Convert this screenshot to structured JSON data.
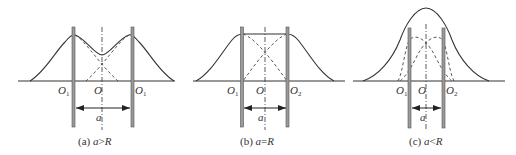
{
  "figure": {
    "panels": [
      {
        "id": "a",
        "caption_prefix": "(a) ",
        "caption_var": "a",
        "caption_rel": ">",
        "caption_rhs": "R",
        "labels": {
          "left": "O",
          "left_sub": "1",
          "center": "O",
          "right": "O",
          "right_sub": "1",
          "distance": "a"
        }
      },
      {
        "id": "b",
        "caption_prefix": "(b) ",
        "caption_var": "a",
        "caption_rel": "=",
        "caption_rhs": "R",
        "labels": {
          "left": "O",
          "left_sub": "1",
          "center": "O",
          "right": "O",
          "right_sub": "2",
          "distance": "a"
        }
      },
      {
        "id": "c",
        "caption_prefix": "(c) ",
        "caption_var": "a",
        "caption_rel": "<",
        "caption_rhs": "R",
        "labels": {
          "left": "O",
          "left_sub": "1",
          "center": "O",
          "right": "O",
          "right_sub": "2",
          "distance": "a"
        }
      }
    ],
    "colors": {
      "line": "#333333",
      "bar_fill": "#9a9a9a",
      "bar_stroke": "#555555"
    }
  }
}
